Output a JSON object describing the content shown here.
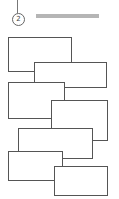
{
  "header": {
    "step_number": "2",
    "title_placeholder_bar": true
  },
  "rectangles": [
    {
      "x": 8,
      "y": 37,
      "w": 64,
      "h": 35
    },
    {
      "x": 34,
      "y": 62,
      "w": 73,
      "h": 26
    },
    {
      "x": 8,
      "y": 82,
      "w": 57,
      "h": 37
    },
    {
      "x": 51,
      "y": 100,
      "w": 57,
      "h": 41
    },
    {
      "x": 18,
      "y": 128,
      "w": 75,
      "h": 31
    },
    {
      "x": 8,
      "y": 151,
      "w": 55,
      "h": 30
    },
    {
      "x": 54,
      "y": 166,
      "w": 54,
      "h": 30
    }
  ],
  "colors": {
    "border": "#555555",
    "bar": "#b5b5b5",
    "background": "#ffffff"
  }
}
